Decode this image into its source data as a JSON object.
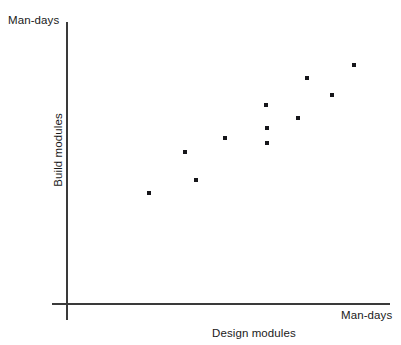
{
  "axes": {
    "y_units_label": "Man-days",
    "x_units_label": "Man-days",
    "x_title": "Design modules",
    "y_title": "Build modules"
  },
  "colors": {
    "axis": "#3a3a3a",
    "point": "#16161a",
    "background": "#ffffff",
    "text": "#1a1a1a"
  },
  "chart_data": {
    "type": "scatter",
    "title": "",
    "subtitle": "",
    "xlabel": "Design modules",
    "ylabel": "Build modules",
    "x_units": "Man-days",
    "y_units": "Man-days",
    "grid": false,
    "legend": false,
    "axis_ticks": false,
    "xlim": [
      0,
      100
    ],
    "ylim": [
      0,
      100
    ],
    "series": [
      {
        "name": "modules",
        "points": [
          {
            "x": 25.5,
            "y": 39.5
          },
          {
            "x": 36.5,
            "y": 54.0
          },
          {
            "x": 40.0,
            "y": 43.8
          },
          {
            "x": 49.0,
            "y": 58.9
          },
          {
            "x": 61.8,
            "y": 62.5
          },
          {
            "x": 62.0,
            "y": 57.1
          },
          {
            "x": 61.6,
            "y": 70.6
          },
          {
            "x": 71.4,
            "y": 66.1
          },
          {
            "x": 74.2,
            "y": 80.0
          },
          {
            "x": 81.9,
            "y": 74.1
          },
          {
            "x": 88.9,
            "y": 84.8
          }
        ]
      }
    ]
  }
}
